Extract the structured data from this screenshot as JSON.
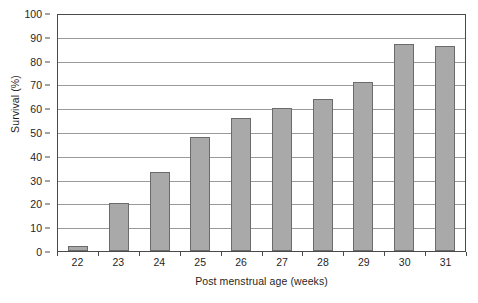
{
  "chart_data": {
    "type": "bar",
    "title": "",
    "xlabel": "Post menstrual age (weeks)",
    "ylabel": "Survival (%)",
    "categories": [
      "22",
      "23",
      "24",
      "25",
      "26",
      "27",
      "28",
      "29",
      "30",
      "31"
    ],
    "values": [
      2,
      20,
      33,
      48,
      56,
      60,
      64,
      71,
      87,
      86
    ],
    "ylim": [
      0,
      100
    ],
    "yticks": [
      0,
      10,
      20,
      30,
      40,
      50,
      60,
      70,
      80,
      90,
      100
    ],
    "ytick_labels": [
      "0",
      "10",
      "20",
      "30",
      "40",
      "50",
      "60",
      "70",
      "80",
      "90",
      "100"
    ],
    "grid": true,
    "grid_axis": "y",
    "legend": false,
    "legend_position": "none",
    "bar_color": "#a9a9a9",
    "bar_edge_color": "#6b6b6b",
    "axis_color": "#4a4a4a",
    "grid_color": "#9a9a9a",
    "background_color": "#ffffff"
  }
}
